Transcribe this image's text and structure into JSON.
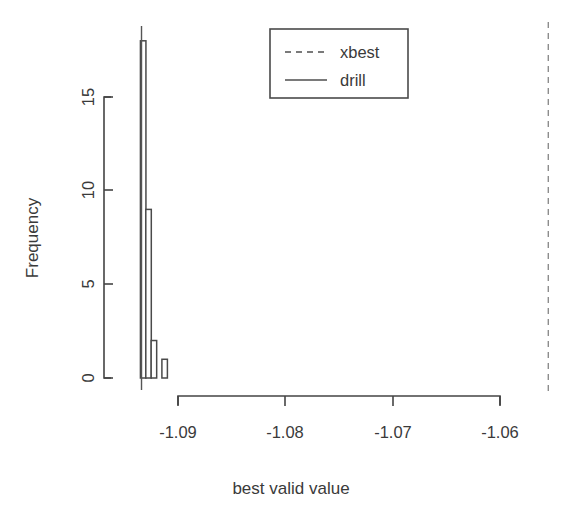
{
  "chart_data": {
    "type": "bar",
    "title": "",
    "subtitle": "",
    "xlabel": "best valid value",
    "ylabel": "Frequency",
    "xlim": [
      -1.0955,
      -1.0545
    ],
    "ylim": [
      0,
      18.6
    ],
    "xticks": [
      -1.09,
      -1.08,
      -1.07,
      -1.06
    ],
    "xtick_labels": [
      "-1.09",
      "-1.08",
      "-1.07",
      "-1.06"
    ],
    "yticks": [
      0,
      5,
      10,
      15
    ],
    "ytick_labels": [
      "0",
      "5",
      "10",
      "15"
    ],
    "grid": false,
    "legend_position": "top-center-right",
    "bin_width": 0.0005,
    "bins": [
      {
        "x_left": -1.0935,
        "x_right": -1.093,
        "value": 18
      },
      {
        "x_left": -1.093,
        "x_right": -1.0925,
        "value": 9
      },
      {
        "x_left": -1.0925,
        "x_right": -1.092,
        "value": 2
      },
      {
        "x_left": -1.092,
        "x_right": -1.0915,
        "value": 0
      },
      {
        "x_left": -1.0915,
        "x_right": -1.091,
        "value": 1
      }
    ],
    "categories": [
      "-1.0935",
      "-1.0930",
      "-1.0925",
      "-1.0920",
      "-1.0915"
    ],
    "values": [
      18,
      9,
      2,
      0,
      1
    ],
    "vlines": [
      {
        "name": "drill",
        "x": -1.0934,
        "style": "solid"
      },
      {
        "name": "xbest",
        "x": -1.0555,
        "style": "dashed"
      }
    ],
    "legend": [
      {
        "label": "xbest",
        "style": "dashed"
      },
      {
        "label": "drill",
        "style": "solid"
      }
    ]
  },
  "colors": {
    "background": "#ffffff",
    "ink": "#3a3a3a",
    "axis": "#444444",
    "bar_stroke": "#4a4a4a",
    "bar_fill": "#ffffff",
    "vline_solid": "#555555",
    "vline_dashed": "#8d8d8d"
  }
}
